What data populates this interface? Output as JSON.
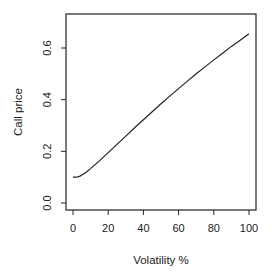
{
  "chart_data": {
    "type": "line",
    "title": "",
    "xlabel": "Volatility %",
    "ylabel": "Call price",
    "xlim": [
      0,
      100
    ],
    "ylim": [
      0.0,
      0.7
    ],
    "xticks": [
      0,
      20,
      40,
      60,
      80,
      100
    ],
    "xtick_labels": [
      "0",
      "20",
      "40",
      "60",
      "80",
      "100"
    ],
    "yticks": [
      0.0,
      0.2,
      0.4,
      0.6
    ],
    "ytick_labels": [
      "0.0",
      "0.2",
      "0.4",
      "0.6"
    ],
    "grid": false,
    "legend": null,
    "series": [
      {
        "name": "Call price",
        "x": [
          0,
          2,
          4,
          6,
          8,
          10,
          15,
          20,
          25,
          30,
          35,
          40,
          45,
          50,
          55,
          60,
          65,
          70,
          75,
          80,
          85,
          90,
          95,
          100
        ],
        "values": [
          0.1,
          0.1,
          0.104,
          0.112,
          0.122,
          0.133,
          0.163,
          0.195,
          0.227,
          0.259,
          0.291,
          0.322,
          0.353,
          0.384,
          0.414,
          0.443,
          0.472,
          0.5,
          0.527,
          0.554,
          0.58,
          0.606,
          0.63,
          0.655
        ]
      }
    ]
  }
}
